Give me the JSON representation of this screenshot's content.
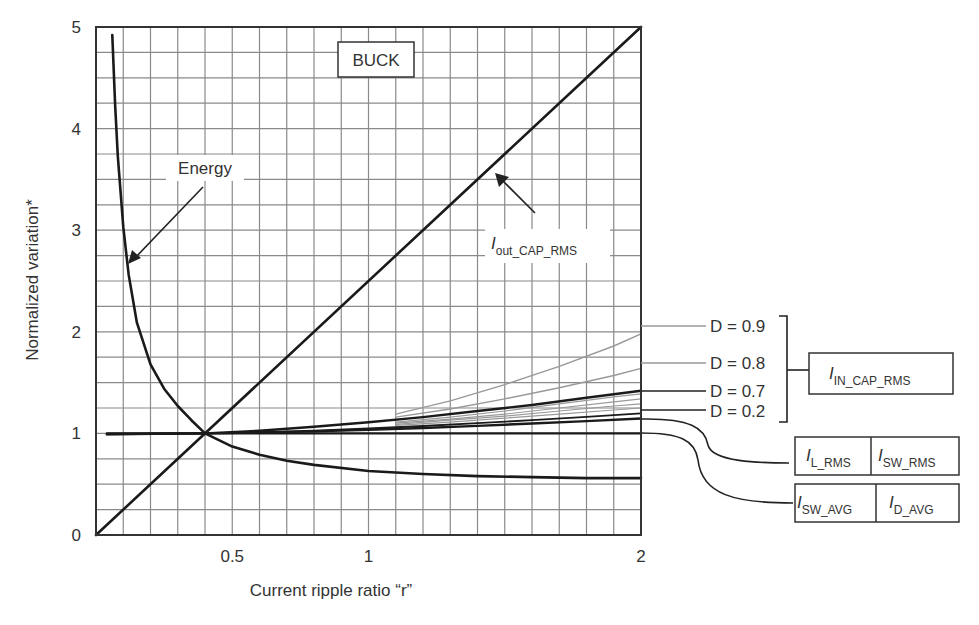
{
  "chart_data": {
    "type": "line",
    "title": "BUCK",
    "xlabel": "Current ripple ratio “r”",
    "ylabel": "Normalized variation*",
    "xlim": [
      0,
      2
    ],
    "ylim": [
      0,
      5
    ],
    "grid": true,
    "x_ticks": [
      {
        "value": 0.5,
        "label": "0.5"
      },
      {
        "value": 1,
        "label": "1"
      },
      {
        "value": 2,
        "label": "2"
      }
    ],
    "y_ticks": [
      {
        "value": 0,
        "label": "0"
      },
      {
        "value": 1,
        "label": "1"
      },
      {
        "value": 2,
        "label": "2"
      },
      {
        "value": 3,
        "label": "3"
      },
      {
        "value": 4,
        "label": "4"
      },
      {
        "value": 5,
        "label": "5"
      }
    ],
    "series": [
      {
        "name": "Energy",
        "color": "#1a1a1a",
        "width": 2.6,
        "x": [
          0.06,
          0.07,
          0.08,
          0.1,
          0.12,
          0.15,
          0.2,
          0.25,
          0.3,
          0.35,
          0.4,
          0.5,
          0.6,
          0.7,
          0.8,
          1.0,
          1.2,
          1.4,
          1.6,
          1.8,
          2.0
        ],
        "y": [
          4.92,
          4.24,
          3.73,
          3.03,
          2.56,
          2.09,
          1.68,
          1.44,
          1.27,
          1.13,
          1.0,
          0.87,
          0.79,
          0.73,
          0.69,
          0.63,
          0.6,
          0.58,
          0.57,
          0.56,
          0.56
        ]
      },
      {
        "name": "Iout_CAP_RMS",
        "color": "#1a1a1a",
        "width": 2.6,
        "x": [
          0,
          2
        ],
        "y": [
          0,
          5
        ]
      },
      {
        "name": "I_SW_AVG / I_D_AVG",
        "color": "#1a1a1a",
        "width": 2.4,
        "x": [
          0.04,
          2
        ],
        "y": [
          1.0,
          1.0
        ]
      },
      {
        "name": "I_L_RMS / I_SW_RMS",
        "color": "#1a1a1a",
        "width": 2.4,
        "x": [
          0.04,
          0.4,
          0.6,
          0.8,
          1.0,
          1.2,
          1.4,
          1.6,
          1.8,
          2.0
        ],
        "y": [
          0.994,
          1.0,
          1.008,
          1.02,
          1.035,
          1.053,
          1.074,
          1.097,
          1.121,
          1.147
        ]
      },
      {
        "name": "D = 0.2",
        "color": "#1a1a1a",
        "width": 1.8,
        "x": [
          0.04,
          0.4,
          0.6,
          0.8,
          1.0,
          1.2,
          1.4,
          1.6,
          1.8,
          2.0
        ],
        "y": [
          0.992,
          1.0,
          1.012,
          1.028,
          1.048,
          1.073,
          1.1,
          1.13,
          1.163,
          1.198
        ]
      },
      {
        "name": "D = 0.3",
        "color": "#999999",
        "width": 1.2,
        "x": [
          1.1,
          1.3,
          1.5,
          1.7,
          1.9,
          2.0
        ],
        "y": [
          1.08,
          1.11,
          1.15,
          1.19,
          1.23,
          1.25
        ]
      },
      {
        "name": "D = 0.4",
        "color": "#999999",
        "width": 1.2,
        "x": [
          1.1,
          1.3,
          1.5,
          1.7,
          1.9,
          2.0
        ],
        "y": [
          1.09,
          1.13,
          1.17,
          1.22,
          1.27,
          1.29
        ]
      },
      {
        "name": "D = 0.5",
        "color": "#999999",
        "width": 1.2,
        "x": [
          1.1,
          1.3,
          1.5,
          1.7,
          1.9,
          2.0
        ],
        "y": [
          1.1,
          1.14,
          1.19,
          1.25,
          1.31,
          1.34
        ]
      },
      {
        "name": "D = 0.6",
        "color": "#999999",
        "width": 1.2,
        "x": [
          1.1,
          1.3,
          1.5,
          1.7,
          1.9,
          2.0
        ],
        "y": [
          1.11,
          1.16,
          1.22,
          1.29,
          1.36,
          1.39
        ]
      },
      {
        "name": "D = 0.7",
        "color": "#1a1a1a",
        "width": 2.4,
        "x": [
          0.04,
          0.4,
          0.6,
          0.8,
          1.0,
          1.2,
          1.4,
          1.6,
          1.8,
          2.0
        ],
        "y": [
          0.99,
          1.0,
          1.027,
          1.065,
          1.11,
          1.16,
          1.22,
          1.28,
          1.35,
          1.42
        ]
      },
      {
        "name": "D = 0.8",
        "color": "#999999",
        "width": 1.4,
        "x": [
          1.1,
          1.3,
          1.5,
          1.7,
          1.9,
          2.0
        ],
        "y": [
          1.16,
          1.24,
          1.34,
          1.45,
          1.57,
          1.64
        ]
      },
      {
        "name": "D = 0.9",
        "color": "#999999",
        "width": 1.4,
        "x": [
          1.1,
          1.3,
          1.5,
          1.7,
          1.9,
          2.0
        ],
        "y": [
          1.19,
          1.32,
          1.48,
          1.66,
          1.86,
          1.98
        ]
      }
    ],
    "annotations": [
      {
        "text": "BUCK",
        "boxed": true
      },
      {
        "text": "Energy",
        "arrow_to": [
          0.12,
          2.7
        ]
      },
      {
        "text": "Iout_CAP_RMS",
        "main": "I",
        "sub": "out_CAP_RMS",
        "arrow_to": [
          1.47,
          3.7
        ]
      },
      {
        "text": "D = 0.9"
      },
      {
        "text": "D = 0.8"
      },
      {
        "text": "D = 0.7"
      },
      {
        "text": "D = 0.2"
      },
      {
        "text": "IIN_CAP_RMS",
        "main": "I",
        "sub": "IN_CAP_RMS",
        "boxed": true,
        "brackets": [
          "D = 0.9",
          "D = 0.8",
          "D = 0.7",
          "D = 0.2"
        ]
      },
      {
        "text": "IL_RMS | ISW_RMS",
        "boxed": true
      },
      {
        "text": "ISW_AVG | ID_AVG",
        "boxed": true
      }
    ]
  },
  "labels": {
    "title_box": "BUCK",
    "energy": "Energy",
    "iout_main": "I",
    "iout_sub": "out_CAP_RMS",
    "d09": "D = 0.9",
    "d08": "D = 0.8",
    "d07": "D = 0.7",
    "d02": "D = 0.2",
    "iin_main": "I",
    "iin_sub": "IN_CAP_RMS",
    "il_main": "I",
    "il_sub": "L_RMS",
    "isw_main": "I",
    "isw_sub": "SW_RMS",
    "iswavg_main": "I",
    "iswavg_sub": "SW_AVG",
    "idavg_main": "I",
    "idavg_sub": "D_AVG"
  },
  "colors": {
    "grid": "#8a8a8a",
    "frame": "#333333",
    "curve_dark": "#1a1a1a",
    "curve_light": "#999999"
  }
}
